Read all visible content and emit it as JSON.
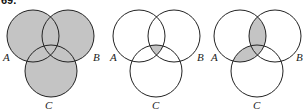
{
  "problem_number": "69.",
  "colors": {
    "shade": "#c4c4c4",
    "stroke": "#222222"
  },
  "diagrams": [
    {
      "labels": {
        "a": "A",
        "b": "B",
        "c": "C"
      },
      "shaded": "A ∪ B ∪ C"
    },
    {
      "labels": {
        "a": "A",
        "b": "B",
        "c": "C"
      },
      "shaded": "A ∩ B ∩ C"
    },
    {
      "labels": {
        "a": "A",
        "b": "B",
        "c": "C"
      },
      "shaded": "(A ∩ B) ∪ (A ∩ C)"
    }
  ]
}
